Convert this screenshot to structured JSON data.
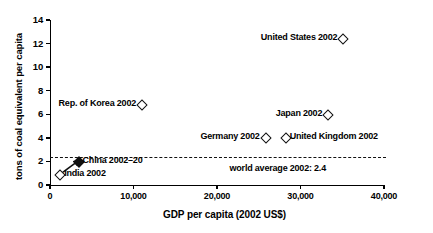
{
  "chart_data": {
    "type": "scatter",
    "title": "",
    "xlabel": "GDP per capita (2002 US$)",
    "ylabel": "tons of coal equivalent per capita",
    "xlim": [
      0,
      40000
    ],
    "ylim": [
      0,
      14
    ],
    "xticks": [
      "0",
      "10,000",
      "20,000",
      "30,000",
      "40,000"
    ],
    "xtick_values": [
      0,
      10000,
      20000,
      30000,
      40000
    ],
    "yticks": [
      "0",
      "2",
      "4",
      "6",
      "8",
      "10",
      "12",
      "14"
    ],
    "ytick_values": [
      0,
      2,
      4,
      6,
      8,
      10,
      12,
      14
    ],
    "grid": false,
    "legend": "none",
    "points": [
      {
        "name": "United States 2002",
        "x": 35000,
        "y": 12.5,
        "marker": "open-diamond",
        "label_side": "left"
      },
      {
        "name": "Rep. of Korea 2002",
        "x": 10900,
        "y": 6.9,
        "marker": "open-diamond",
        "label_side": "left"
      },
      {
        "name": "Japan 2002",
        "x": 33200,
        "y": 6.0,
        "marker": "open-diamond",
        "label_side": "left"
      },
      {
        "name": "Germany 2002",
        "x": 25700,
        "y": 4.1,
        "marker": "open-diamond",
        "label_side": "left"
      },
      {
        "name": "United Kingdom 2002",
        "x": 28100,
        "y": 4.1,
        "marker": "open-diamond",
        "label_side": "right"
      },
      {
        "name": "China 2002-20",
        "x": 3300,
        "y": 2.0,
        "marker": "filled-diamond",
        "label_side": "right"
      },
      {
        "name": "India 2002",
        "x": 1100,
        "y": 0.9,
        "marker": "open-diamond",
        "label_side": "right"
      }
    ],
    "annotations": [
      {
        "name": "world-average-line",
        "type": "hline",
        "value": 2.4,
        "style": "dashed",
        "label": "world average 2002: 2.4"
      }
    ],
    "trend_line": {
      "name": "china-trajectory",
      "from": {
        "x": 1400,
        "y": 1.0
      },
      "to": {
        "x": 3300,
        "y": 2.0
      },
      "arrow": true
    }
  },
  "axis": {
    "y_title": "tons of coal equivalent per capita",
    "x_title": "GDP per capita (2002 US$)"
  },
  "labels": {
    "united_states": "United States 2002",
    "korea": "Rep. of Korea 2002",
    "japan": "Japan 2002",
    "germany": "Germany 2002",
    "united_kingdom": "United Kingdom 2002",
    "china": "China 2002–20",
    "india": "India 2002",
    "world_average": "world average 2002: 2.4"
  }
}
